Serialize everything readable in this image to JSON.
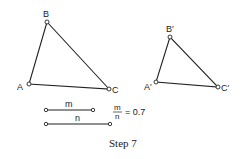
{
  "diagram": {
    "caption": "Step 7",
    "triangle_original": {
      "labels": {
        "A": "A",
        "B": "B",
        "C": "C"
      }
    },
    "triangle_image": {
      "labels": {
        "A": "A′",
        "B": "B′",
        "C": "C′"
      }
    },
    "segments": {
      "m_label": "m",
      "n_label": "n"
    },
    "ratio": {
      "numerator": "m",
      "denominator": "n",
      "equals_text": "= 0.7",
      "value": 0.7
    }
  }
}
